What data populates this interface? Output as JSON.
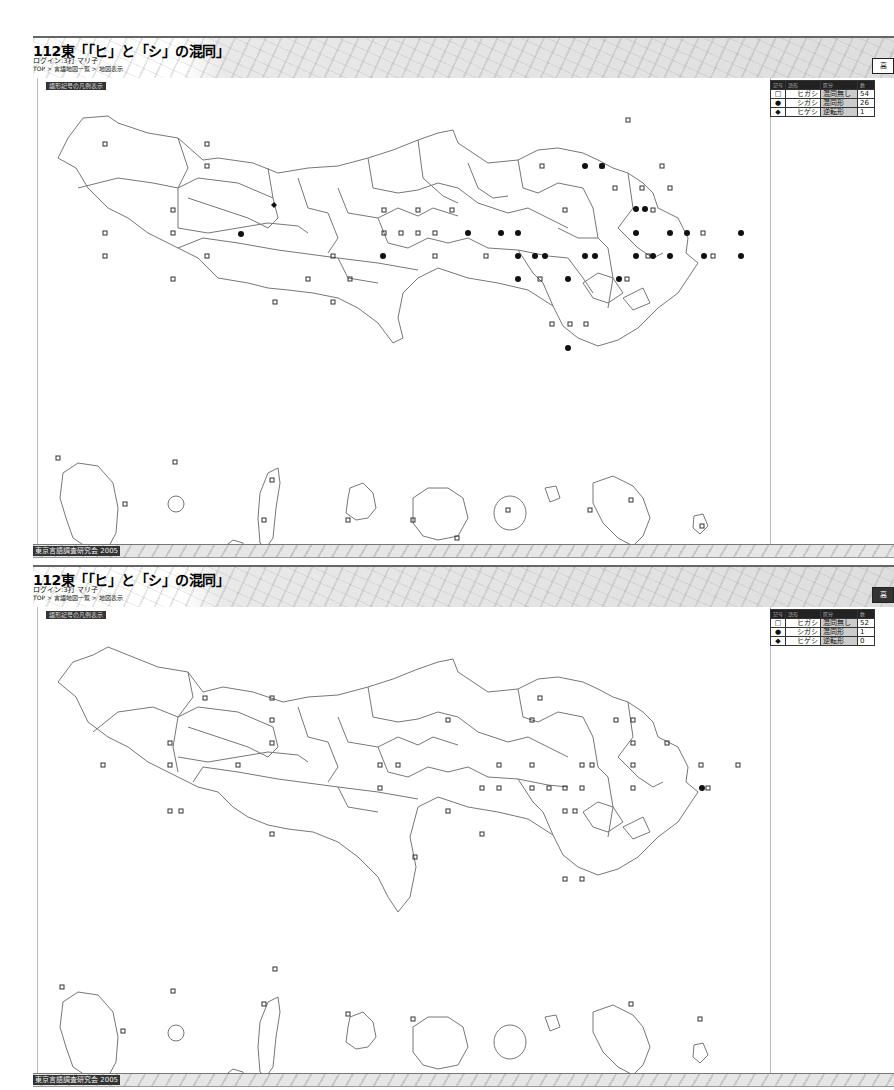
{
  "panels": [
    {
      "header": {
        "title": "112東「「ヒ」と「シ」の混同」",
        "login": "ログイン:3打 マリ子",
        "breadcrumb": "TOP > 言語地図一覧 > 地図表示",
        "button_label": "高"
      },
      "map_label": "語形記号の凡例表示",
      "legend": {
        "header": [
          "記号",
          "語形",
          "区分",
          "数"
        ],
        "rows": [
          {
            "symbol": "□",
            "form": "ヒガシ",
            "category": "混同無し",
            "count": "54"
          },
          {
            "symbol": "●",
            "form": "シガシ",
            "category": "混同形",
            "count": "26"
          },
          {
            "symbol": "◆",
            "form": "ヒゲシ",
            "category": "逆転形",
            "count": "1"
          }
        ]
      },
      "footer": "東京言語調査研究会 2005"
    },
    {
      "header": {
        "title": "112東「「ヒ」と「シ」の混同」",
        "login": "ログイン:3打 マリ子",
        "breadcrumb": "TOP > 言語地図一覧 > 地図表示",
        "button_label": "高"
      },
      "map_label": "語形記号の凡例表示",
      "legend": {
        "header": [
          "記号",
          "語形",
          "区分",
          "数"
        ],
        "rows": [
          {
            "symbol": "□",
            "form": "ヒガシ",
            "category": "混同無し",
            "count": "52"
          },
          {
            "symbol": "●",
            "form": "シガシ",
            "category": "混同形",
            "count": "1"
          },
          {
            "symbol": "◆",
            "form": "ヒゲシ",
            "category": "逆転形",
            "count": "0"
          }
        ]
      },
      "footer": "東京言語調査研究会 2005"
    }
  ]
}
